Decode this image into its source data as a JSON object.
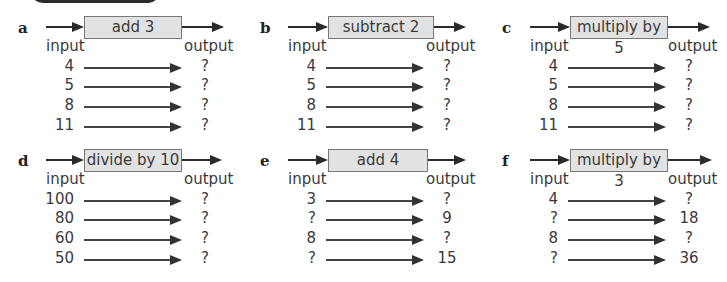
{
  "exercises": [
    {
      "label": "a",
      "function": "add 3",
      "input_header": "input",
      "output_header": "output",
      "rows": [
        {
          "input": "4",
          "output": "?"
        },
        {
          "input": "5",
          "output": "?"
        },
        {
          "input": "8",
          "output": "?"
        },
        {
          "input": "11",
          "output": "?"
        }
      ]
    },
    {
      "label": "b",
      "function": "subtract 2",
      "input_header": "input",
      "output_header": "output",
      "rows": [
        {
          "input": "4",
          "output": "?"
        },
        {
          "input": "5",
          "output": "?"
        },
        {
          "input": "8",
          "output": "?"
        },
        {
          "input": "11",
          "output": "?"
        }
      ]
    },
    {
      "label": "c",
      "function": "multiply by 5",
      "input_header": "input",
      "output_header": "output",
      "rows": [
        {
          "input": "4",
          "output": "?"
        },
        {
          "input": "5",
          "output": "?"
        },
        {
          "input": "8",
          "output": "?"
        },
        {
          "input": "11",
          "output": "?"
        }
      ]
    },
    {
      "label": "d",
      "function": "divide by 10",
      "input_header": "input",
      "output_header": "output",
      "rows": [
        {
          "input": "100",
          "output": "?"
        },
        {
          "input": "80",
          "output": "?"
        },
        {
          "input": "60",
          "output": "?"
        },
        {
          "input": "50",
          "output": "?"
        }
      ]
    },
    {
      "label": "e",
      "function": "add 4",
      "input_header": "input",
      "output_header": "output",
      "rows": [
        {
          "input": "3",
          "output": "?"
        },
        {
          "input": "?",
          "output": "9"
        },
        {
          "input": "8",
          "output": "?"
        },
        {
          "input": "?",
          "output": "15"
        }
      ]
    },
    {
      "label": "f",
      "function": "multiply by 3",
      "input_header": "input",
      "output_header": "output",
      "rows": [
        {
          "input": "4",
          "output": "?"
        },
        {
          "input": "?",
          "output": "18"
        },
        {
          "input": "8",
          "output": "?"
        },
        {
          "input": "?",
          "output": "36"
        }
      ]
    }
  ],
  "colors": {
    "box_fill": "#e2e2e2",
    "box_border": "#777777",
    "arrow": "#2a2a2a",
    "text": "#3a3a3a"
  }
}
